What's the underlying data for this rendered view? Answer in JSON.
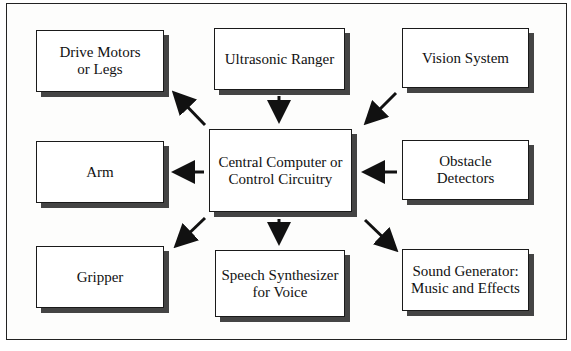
{
  "diagram": {
    "center": {
      "label_line1": "Central Computer or",
      "label_line2": "Control Circuitry"
    },
    "inputs": [
      {
        "label": "Ultrasonic Ranger"
      },
      {
        "label": "Vision System"
      },
      {
        "label_line1": "Obstacle",
        "label_line2": "Detectors"
      }
    ],
    "outputs": [
      {
        "label_line1": "Drive Motors",
        "label_line2": "or Legs"
      },
      {
        "label": "Arm"
      },
      {
        "label": "Gripper"
      },
      {
        "label_line1": "Speech Synthesizer",
        "label_line2": "for Voice"
      },
      {
        "label_line1": "Sound Generator:",
        "label_line2": "Music and Effects"
      }
    ],
    "colors": {
      "border": "#1a1a1a",
      "shadow": "#444444",
      "arrow": "#111111",
      "background": "#ffffff"
    }
  }
}
